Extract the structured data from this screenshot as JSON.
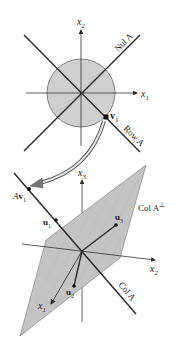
{
  "top_figure": {
    "axis_x1": "x",
    "axis_x1_sub": "1",
    "axis_x2": "x",
    "axis_x2_sub": "2",
    "nul_label": "Nul A",
    "row_label": "Row A",
    "v1_label": "v",
    "v1_sub": "1"
  },
  "bottom_figure": {
    "axis_x1": "x",
    "axis_x1_sub": "1",
    "axis_x2": "x",
    "axis_x2_sub": "2",
    "axis_x3": "x",
    "axis_x3_sub": "3",
    "av1_prefix": "A",
    "av1_vec": "v",
    "av1_sub": "1",
    "u1_label": "u",
    "u1_sub": "1",
    "u2_label": "u",
    "u2_sub": "2",
    "u3_label": "u",
    "u3_sub": "3",
    "col_label": "Col A",
    "col_perp_label": "Col A",
    "col_perp_sup": "⊥"
  },
  "colors": {
    "circle_fill": "#cfcfcf",
    "plane_fill": "#c4c4c4",
    "line": "#2a2a2a",
    "arrow_fill": "#9a9a9a"
  }
}
